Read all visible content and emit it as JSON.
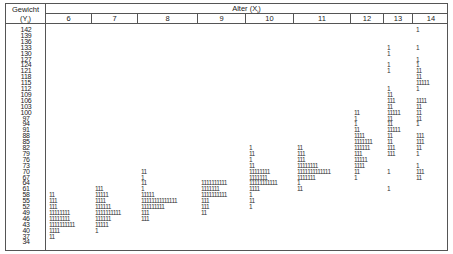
{
  "header": {
    "left_title": "Gewicht",
    "left_sub": "(Y",
    "left_sub_idx": "i",
    "left_sub_close": ")",
    "top_title": "Alter (X",
    "top_title_idx": "i",
    "top_title_close": ")"
  },
  "columns": [
    "6",
    "7",
    "8",
    "9",
    "10",
    "11",
    "12",
    "13",
    "14"
  ],
  "column_x": [
    40,
    86,
    132,
    192,
    240,
    288,
    345,
    378,
    407,
    443
  ],
  "y_labels": [
    "142",
    "139",
    "136",
    "133",
    "130",
    "127",
    "124",
    "121",
    "118",
    "115",
    "112",
    "109",
    "106",
    "103",
    "100",
    "97",
    "94",
    "91",
    "88",
    "85",
    "82",
    "79",
    "76",
    "73",
    "70",
    "67",
    "64",
    "61",
    "58",
    "55",
    "52",
    "49",
    "46",
    "43",
    "40",
    "37",
    "34"
  ],
  "chart_data": {
    "type": "table",
    "xlabel": "Alter (X_i)",
    "ylabel": "Gewicht (Y_i)",
    "x_categories": [
      "6",
      "7",
      "8",
      "9",
      "10",
      "11",
      "12",
      "13",
      "14"
    ],
    "y_categories": [
      "142",
      "139",
      "136",
      "133",
      "130",
      "127",
      "124",
      "121",
      "118",
      "115",
      "112",
      "109",
      "106",
      "103",
      "100",
      "97",
      "94",
      "91",
      "88",
      "85",
      "82",
      "79",
      "76",
      "73",
      "70",
      "67",
      "64",
      "61",
      "58",
      "55",
      "52",
      "49",
      "46",
      "43",
      "40",
      "37",
      "34"
    ],
    "counts": {
      "6": {
        "58": 2,
        "55": 3,
        "52": 3,
        "49": 8,
        "46": 8,
        "43": 10,
        "40": 4,
        "37": 2
      },
      "7": {
        "61": 3,
        "58": 5,
        "55": 4,
        "52": 6,
        "49": 10,
        "46": 6,
        "43": 5,
        "40": 1
      },
      "8": {
        "70": 2,
        "67": 1,
        "64": 2,
        "61": 1,
        "58": 5,
        "55": 14,
        "52": 9,
        "49": 3,
        "46": 3
      },
      "9": {
        "64": 10,
        "61": 7,
        "58": 10,
        "55": 3,
        "52": 3,
        "49": 2
      },
      "10": {
        "82": 1,
        "79": 2,
        "76": 1,
        "73": 2,
        "70": 8,
        "67": 7,
        "64": 11,
        "61": 4,
        "58": 1,
        "55": 2,
        "52": 1
      },
      "11": {
        "82": 2,
        "79": 3,
        "76": 3,
        "73": 8,
        "70": 13,
        "67": 7,
        "64": 1,
        "61": 2
      },
      "12": {
        "100": 2,
        "97": 1,
        "94": 1,
        "91": 2,
        "88": 4,
        "85": 7,
        "82": 6,
        "79": 3,
        "76": 5,
        "73": 4,
        "70": 2,
        "67": 1
      },
      "13": {
        "133": 1,
        "130": 1,
        "124": 1,
        "121": 1,
        "112": 1,
        "109": 2,
        "106": 3,
        "103": 2,
        "100": 5,
        "97": 2,
        "94": 2,
        "91": 5,
        "88": 2,
        "85": 2,
        "82": 3,
        "79": 3,
        "70": 1,
        "61": 1
      },
      "14": {
        "142": 1,
        "133": 1,
        "127": 1,
        "124": 1,
        "121": 2,
        "118": 2,
        "115": 5,
        "112": 1,
        "106": 4,
        "103": 2,
        "100": 2,
        "97": 2,
        "94": 1,
        "88": 3,
        "85": 3,
        "82": 2,
        "79": 1,
        "73": 1,
        "70": 3,
        "67": 2
      }
    }
  }
}
